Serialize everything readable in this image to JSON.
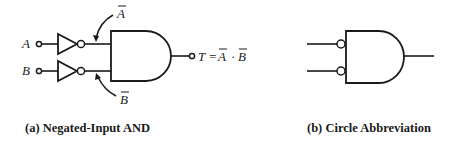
{
  "figure_a": {
    "input_a_label": "A",
    "input_b_label": "B",
    "not_a_label": "A",
    "not_b_label": "B",
    "output_label": "T = ",
    "output_expr_a": "A",
    "output_expr_dot": "·",
    "output_expr_b": "B",
    "caption": "(a) Negated-Input AND"
  },
  "figure_b": {
    "caption": "(b) Circle Abbreviation"
  }
}
